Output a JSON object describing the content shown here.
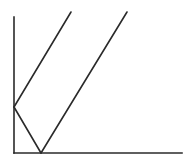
{
  "diagram": {
    "stroke_color": "#2a2a2a",
    "background": "#ffffff",
    "axes": {
      "y_axis": {
        "x1": 14,
        "y1": 17,
        "x2": 14,
        "y2": 153
      },
      "x_axis": {
        "x1": 14,
        "y1": 153,
        "x2": 182,
        "y2": 153
      }
    },
    "segments": [
      {
        "name": "left-diagonal-up",
        "x1": 14,
        "y1": 107,
        "x2": 71,
        "y2": 12
      },
      {
        "name": "reflection-down",
        "x1": 14,
        "y1": 107,
        "x2": 41,
        "y2": 153
      },
      {
        "name": "right-diagonal-up",
        "x1": 41,
        "y1": 153,
        "x2": 127,
        "y2": 12
      }
    ]
  }
}
